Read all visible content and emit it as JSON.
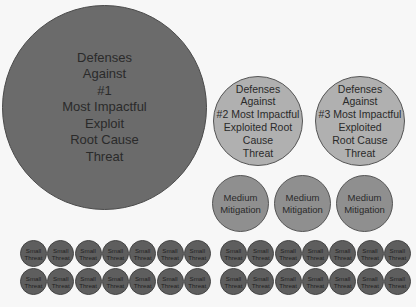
{
  "diagram": {
    "primary": {
      "label": "Defenses\nAgainst\n#1\nMost Impactful\nExploit\nRoot Cause\nThreat",
      "color": "#6b6b6b"
    },
    "secondary": [
      {
        "label": "Defenses\nAgainst\n#2 Most Impactful\nExploited Root\nCause\nThreat",
        "color": "#b0b0b0"
      },
      {
        "label": "Defenses\nAgainst\n#3 Most Impactful\nExploited\nRoot Cause\nThreat",
        "color": "#b0b0b0"
      }
    ],
    "medium": [
      {
        "label": "Medium\nMitigation"
      },
      {
        "label": "Medium\nMitigation"
      },
      {
        "label": "Medium\nMitigation"
      }
    ],
    "small_label": "Small\nThreat",
    "small_groups": 2,
    "small_rows": 2,
    "small_per_row": 7
  }
}
